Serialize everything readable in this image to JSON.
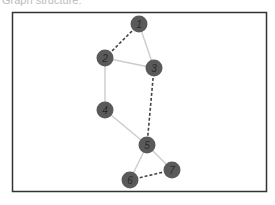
{
  "caption_cut": "Graph structure:",
  "graph": {
    "nodes": [
      {
        "id": "1",
        "x": 139,
        "y": 24
      },
      {
        "id": "2",
        "x": 105,
        "y": 58
      },
      {
        "id": "3",
        "x": 154,
        "y": 68
      },
      {
        "id": "4",
        "x": 105,
        "y": 110
      },
      {
        "id": "5",
        "x": 147,
        "y": 145
      },
      {
        "id": "6",
        "x": 130,
        "y": 180
      },
      {
        "id": "7",
        "x": 172,
        "y": 170
      }
    ],
    "edges": [
      {
        "from": "1",
        "to": "2",
        "style": "dashed"
      },
      {
        "from": "1",
        "to": "3",
        "style": "solid"
      },
      {
        "from": "2",
        "to": "3",
        "style": "solid"
      },
      {
        "from": "2",
        "to": "4",
        "style": "solid"
      },
      {
        "from": "3",
        "to": "5",
        "style": "dashed"
      },
      {
        "from": "4",
        "to": "5",
        "style": "solid"
      },
      {
        "from": "5",
        "to": "6",
        "style": "solid"
      },
      {
        "from": "5",
        "to": "7",
        "style": "solid"
      },
      {
        "from": "6",
        "to": "7",
        "style": "dashed"
      }
    ],
    "colors": {
      "node_fill": "#5a5a5a",
      "node_label": "#2a2a2a",
      "solid_edge": "#cccccc",
      "dashed_edge": "#444444",
      "frame": "#333333"
    }
  }
}
